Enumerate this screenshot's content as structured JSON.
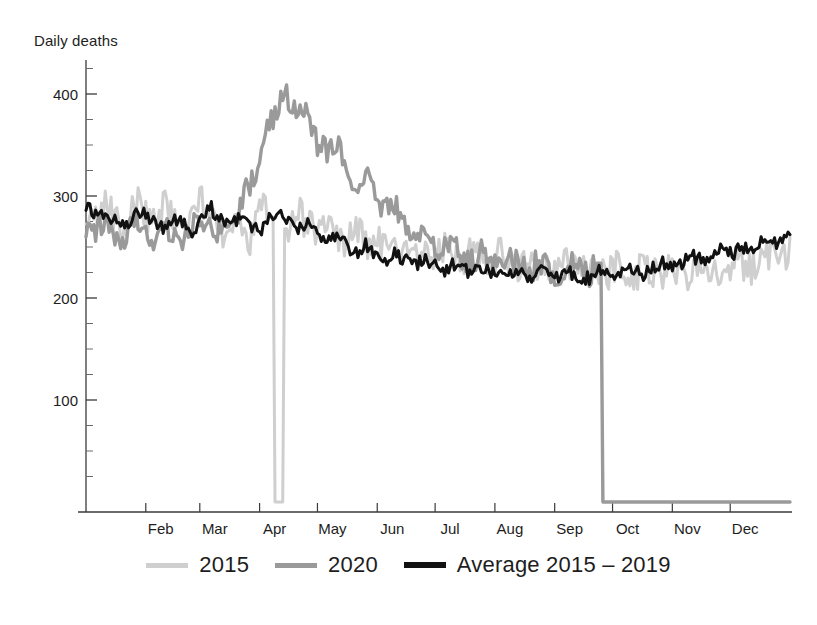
{
  "chart": {
    "axis_title": "Daily deaths"
  },
  "legend": {
    "items": [
      {
        "label": "2015",
        "color": "#cfcfcf",
        "swatch": "line-swatch-2015"
      },
      {
        "label": "2020",
        "color": "#9a9a9a",
        "swatch": "line-swatch-2020"
      },
      {
        "label": "Average 2015 – 2019",
        "color": "#111111",
        "swatch": "line-swatch-average"
      }
    ]
  },
  "chart_data": {
    "type": "line",
    "title": "Daily deaths",
    "xlabel": "",
    "ylabel": "Daily deaths",
    "ylim": [
      0,
      425
    ],
    "yticks": [
      100,
      200,
      300,
      400
    ],
    "ytick_labels": [
      "100",
      "200",
      "300",
      "400"
    ],
    "y_minor_tick_step": 25,
    "grid": false,
    "legend_position": "bottom",
    "x_tick_labels": [
      "Feb",
      "Mar",
      "Apr",
      "May",
      "Jun",
      "Jul",
      "Aug",
      "Sep",
      "Oct",
      "Nov",
      "Dec"
    ],
    "x_tick_days": [
      31,
      59,
      90,
      120,
      151,
      181,
      212,
      243,
      273,
      304,
      334
    ],
    "x_range_days": [
      0,
      365
    ],
    "notes": [
      "2020 series data ends at 1 September and drops vertically to zero",
      "2015 series has a single-day dropout artifact to zero at 1 March",
      "2020 shows a large spring excess-mortality peak reaching about 400 in early April"
    ],
    "series": [
      {
        "name": "2015",
        "color": "#cfcfcf",
        "sample_step_days": 5,
        "values": [
          288,
          281,
          294,
          276,
          268,
          299,
          284,
          272,
          291,
          278,
          266,
          285,
          296,
          274,
          262,
          281,
          270,
          258,
          292,
          279,
          0,
          268,
          284,
          272,
          259,
          276,
          263,
          251,
          268,
          257,
          246,
          262,
          250,
          241,
          256,
          247,
          238,
          252,
          243,
          235,
          248,
          240,
          232,
          244,
          236,
          228,
          241,
          233,
          226,
          238,
          231,
          224,
          236,
          229,
          222,
          234,
          227,
          221,
          233,
          226,
          220,
          232,
          226,
          221,
          234,
          228,
          223,
          237,
          231,
          226,
          240,
          246,
          238,
          244
        ]
      },
      {
        "name": "2020",
        "color": "#9a9a9a",
        "sample_step_days": 5,
        "values": [
          272,
          266,
          280,
          263,
          258,
          276,
          268,
          259,
          274,
          265,
          256,
          271,
          282,
          268,
          259,
          276,
          290,
          312,
          338,
          366,
          392,
          398,
          374,
          386,
          352,
          340,
          356,
          326,
          310,
          330,
          300,
          286,
          296,
          274,
          262,
          268,
          252,
          244,
          250,
          240,
          234,
          244,
          236,
          229,
          240,
          232,
          226,
          238,
          230,
          224,
          236,
          229,
          223,
          234,
          0,
          0,
          0,
          0,
          0,
          0,
          0,
          0,
          0,
          0,
          0,
          0,
          0,
          0,
          0,
          0,
          0,
          0,
          0,
          0
        ]
      },
      {
        "name": "Average 2015 – 2019",
        "color": "#111111",
        "sample_step_days": 5,
        "values": [
          292,
          284,
          276,
          282,
          272,
          279,
          286,
          275,
          268,
          280,
          273,
          266,
          278,
          288,
          276,
          270,
          282,
          271,
          264,
          276,
          286,
          274,
          266,
          272,
          262,
          254,
          262,
          252,
          245,
          252,
          243,
          237,
          244,
          238,
          232,
          238,
          232,
          227,
          233,
          228,
          224,
          230,
          226,
          222,
          228,
          224,
          221,
          227,
          223,
          220,
          226,
          222,
          219,
          225,
          228,
          224,
          232,
          227,
          223,
          230,
          235,
          229,
          236,
          241,
          236,
          243,
          248,
          243,
          250,
          246,
          253,
          258,
          252,
          268
        ]
      }
    ]
  }
}
